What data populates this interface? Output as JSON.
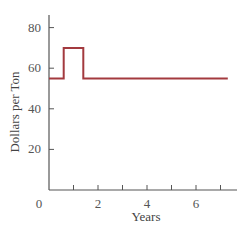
{
  "chart_data": {
    "type": "line",
    "title": "",
    "xlabel": "Years",
    "ylabel": "Dollars per Ton",
    "xlim": [
      0,
      8
    ],
    "ylim": [
      0,
      87
    ],
    "x_ticks": [
      0,
      1,
      2,
      3,
      4,
      5,
      6,
      7
    ],
    "x_tick_labels": [
      "0",
      "",
      "2",
      "",
      "4",
      "",
      "6",
      ""
    ],
    "y_ticks": [
      20,
      40,
      60,
      80
    ],
    "y_tick_labels": [
      "20",
      "40",
      "60",
      "80"
    ],
    "grid": false,
    "legend": null,
    "series": [
      {
        "name": "price",
        "color": "#a33a3f",
        "step": true,
        "x": [
          0,
          0.6,
          0.6,
          1.4,
          1.4,
          7.3
        ],
        "y": [
          55,
          55,
          70,
          70,
          55,
          55
        ]
      }
    ]
  }
}
